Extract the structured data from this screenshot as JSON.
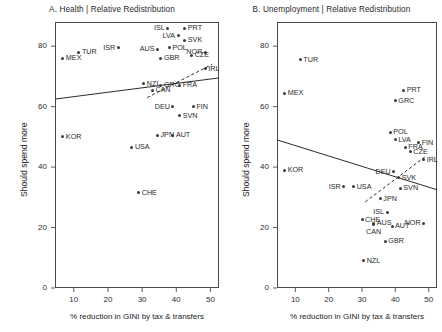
{
  "figure": {
    "axis_label_x": "% reduction in GINI by tax & transfers",
    "axis_label_y": "Should spend more"
  },
  "chart_data": [
    {
      "type": "scatter",
      "panel": "A",
      "title": "A. Health | Relative Redistribution",
      "xlabel": "% reduction in GINI by tax & transfers",
      "ylabel": "Should spend more",
      "xlim": [
        4.5,
        52.5
      ],
      "ylim": [
        0,
        88
      ],
      "xticks": [
        10,
        20,
        30,
        40,
        50
      ],
      "yticks": [
        0,
        20,
        40,
        60,
        80
      ],
      "grid": false,
      "legend": "none",
      "points": [
        {
          "label": "MEX",
          "x": 6.8,
          "y": 76.0,
          "lab": "right"
        },
        {
          "label": "TUR",
          "x": 11.5,
          "y": 78.0,
          "lab": "right"
        },
        {
          "label": "KOR",
          "x": 6.8,
          "y": 50.0,
          "lab": "right"
        },
        {
          "label": "ISR",
          "x": 23.0,
          "y": 79.5,
          "lab": "left"
        },
        {
          "label": "ISL",
          "x": 37.5,
          "y": 86.0,
          "lab": "left"
        },
        {
          "label": "PRT",
          "x": 42.5,
          "y": 86.0,
          "lab": "right"
        },
        {
          "label": "LVA",
          "x": 40.5,
          "y": 83.5,
          "lab": "left"
        },
        {
          "label": "SVK",
          "x": 42.5,
          "y": 82.0,
          "lab": "right"
        },
        {
          "label": "POL",
          "x": 38.0,
          "y": 79.5,
          "lab": "right"
        },
        {
          "label": "AUS",
          "x": 34.5,
          "y": 79.0,
          "lab": "left"
        },
        {
          "label": "GBR",
          "x": 35.5,
          "y": 76.0,
          "lab": "right"
        },
        {
          "label": "NOR",
          "x": 48.5,
          "y": 78.0,
          "lab": "left"
        },
        {
          "label": "CZE",
          "x": 44.5,
          "y": 77.0,
          "lab": "right"
        },
        {
          "label": "IRL",
          "x": 48.5,
          "y": 72.5,
          "lab": "right"
        },
        {
          "label": "NZL",
          "x": 30.5,
          "y": 67.5,
          "lab": "right"
        },
        {
          "label": "GRC",
          "x": 35.5,
          "y": 67.0,
          "lab": "right"
        },
        {
          "label": "FRA",
          "x": 41.0,
          "y": 67.0,
          "lab": "right"
        },
        {
          "label": "CAN",
          "x": 33.0,
          "y": 65.5,
          "lab": "right"
        },
        {
          "label": "DEU",
          "x": 39.0,
          "y": 60.0,
          "lab": "left"
        },
        {
          "label": "FIN",
          "x": 45.0,
          "y": 60.0,
          "lab": "right"
        },
        {
          "label": "SVN",
          "x": 41.0,
          "y": 57.0,
          "lab": "right"
        },
        {
          "label": "JPN",
          "x": 34.5,
          "y": 50.5,
          "lab": "right"
        },
        {
          "label": "AUT",
          "x": 39.0,
          "y": 50.5,
          "lab": "right"
        },
        {
          "label": "USA",
          "x": 27.0,
          "y": 46.5,
          "lab": "right"
        },
        {
          "label": "CHE",
          "x": 29.0,
          "y": 31.5,
          "lab": "right"
        }
      ],
      "solid_fit": {
        "x0": 4.5,
        "y0": 62.5,
        "x1": 52.5,
        "y1": 69.5
      },
      "dashed_fit": {
        "x0": 31.5,
        "y0": 63.0,
        "x1": 50.5,
        "y1": 74.0
      }
    },
    {
      "type": "scatter",
      "panel": "B",
      "title": "B. Unemployment | Relative Redistribution",
      "xlabel": "% reduction in GINI by tax & transfers",
      "ylabel": "Should spend more",
      "xlim": [
        4.5,
        52.5
      ],
      "ylim": [
        0,
        88
      ],
      "xticks": [
        10,
        20,
        30,
        40,
        50
      ],
      "yticks": [
        0,
        20,
        40,
        60,
        80
      ],
      "grid": false,
      "legend": "none",
      "points": [
        {
          "label": "TUR",
          "x": 11.5,
          "y": 75.5,
          "lab": "right"
        },
        {
          "label": "MEX",
          "x": 6.8,
          "y": 64.5,
          "lab": "right"
        },
        {
          "label": "PRT",
          "x": 42.5,
          "y": 65.5,
          "lab": "right"
        },
        {
          "label": "GRC",
          "x": 40.0,
          "y": 62.0,
          "lab": "right"
        },
        {
          "label": "POL",
          "x": 38.5,
          "y": 51.5,
          "lab": "right"
        },
        {
          "label": "LVA",
          "x": 40.0,
          "y": 49.0,
          "lab": "right"
        },
        {
          "label": "FIN",
          "x": 47.0,
          "y": 48.0,
          "lab": "right"
        },
        {
          "label": "FRA",
          "x": 43.0,
          "y": 46.5,
          "lab": "right"
        },
        {
          "label": "CZE",
          "x": 44.5,
          "y": 45.0,
          "lab": "right"
        },
        {
          "label": "IRL",
          "x": 48.5,
          "y": 42.5,
          "lab": "right"
        },
        {
          "label": "KOR",
          "x": 6.8,
          "y": 39.0,
          "lab": "right"
        },
        {
          "label": "DEU",
          "x": 39.5,
          "y": 38.5,
          "lab": "left"
        },
        {
          "label": "SVK",
          "x": 41.0,
          "y": 36.5,
          "lab": "right"
        },
        {
          "label": "ISR",
          "x": 24.5,
          "y": 33.5,
          "lab": "left"
        },
        {
          "label": "USA",
          "x": 27.5,
          "y": 33.5,
          "lab": "right"
        },
        {
          "label": "SVN",
          "x": 41.5,
          "y": 33.0,
          "lab": "right"
        },
        {
          "label": "JPN",
          "x": 35.5,
          "y": 29.5,
          "lab": "right"
        },
        {
          "label": "ISL",
          "x": 37.5,
          "y": 25.0,
          "lab": "left"
        },
        {
          "label": "CHE",
          "x": 30.0,
          "y": 22.5,
          "lab": "right"
        },
        {
          "label": "AUS",
          "x": 33.5,
          "y": 21.5,
          "lab": "right"
        },
        {
          "label": "CAN",
          "x": 33.5,
          "y": 21.0,
          "lab": "below"
        },
        {
          "label": "AUT",
          "x": 39.0,
          "y": 20.5,
          "lab": "right"
        },
        {
          "label": "NOR",
          "x": 48.5,
          "y": 21.5,
          "lab": "left"
        },
        {
          "label": "GBR",
          "x": 37.0,
          "y": 15.5,
          "lab": "right"
        },
        {
          "label": "NZL",
          "x": 30.5,
          "y": 9.0,
          "lab": "right"
        }
      ],
      "solid_fit": {
        "x0": 4.5,
        "y0": 49.0,
        "x1": 52.5,
        "y1": 32.5
      },
      "dashed_fit": {
        "x0": 31.0,
        "y0": 28.5,
        "x1": 49.0,
        "y1": 43.5
      }
    }
  ]
}
